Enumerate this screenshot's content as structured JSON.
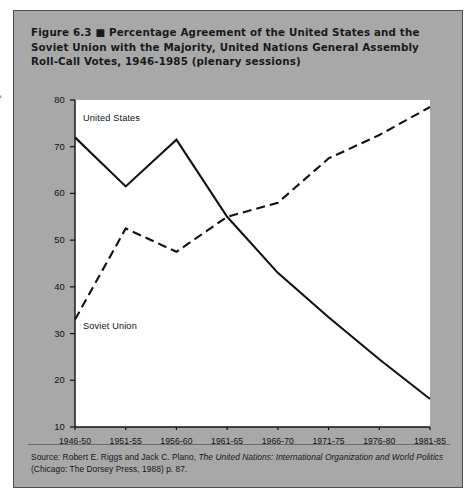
{
  "figure": {
    "label": "Figure 6.3",
    "bullet": "■",
    "title": "Percentage Agreement of the United States and the Soviet Union with the Majority, United Nations General Assembly Roll-Call Votes, 1946-1985 (plenary sessions)",
    "title_line1": "Figure 6.3 ■ Percentage Agreement of the United States and the",
    "title_line2": "Soviet Union with the Majority, United Nations General Assembly",
    "title_line3": "Roll-Call Votes, 1946-1985 (plenary sessions)",
    "source_prefix": "Source: Robert E. Riggs and Jack C. Plano,",
    "source_italic": "The United Nations: International Organization and World Politics",
    "source_suffix": "(Chicago: The Dorsey Press, 1988) p. 87.",
    "panel_color": "#a8a8a8",
    "plot_color": "#ffffff",
    "ink_color": "#111111"
  },
  "chart_data": {
    "type": "line",
    "title": "Percentage Agreement of the United States and the Soviet Union with the Majority, United Nations General Assembly Roll-Call Votes, 1946-1985 (plenary sessions)",
    "xlabel": "",
    "ylabel": "Percent agreement",
    "categories": [
      "1946-50",
      "1951-55",
      "1956-60",
      "1961-65",
      "1966-70",
      "1971-75",
      "1976-80",
      "1981-85"
    ],
    "ylim": [
      10,
      80
    ],
    "yticks": [
      10,
      20,
      30,
      40,
      50,
      60,
      70,
      80
    ],
    "grid": false,
    "legend": "inline-labels",
    "series": [
      {
        "name": "United States",
        "style": "solid",
        "color": "#111111",
        "values": [
          72,
          61.5,
          71.5,
          55,
          43,
          33.5,
          24.5,
          16
        ]
      },
      {
        "name": "Soviet Union",
        "style": "dashed",
        "color": "#111111",
        "values": [
          33,
          52.5,
          47.5,
          55,
          58,
          67.5,
          72.5,
          78.5
        ]
      }
    ],
    "annotations": [
      {
        "text": "United States",
        "x_category": "1946-50",
        "y": 76
      },
      {
        "text": "Soviet Union",
        "x_category": "1946-50",
        "y": 31.5
      }
    ]
  }
}
